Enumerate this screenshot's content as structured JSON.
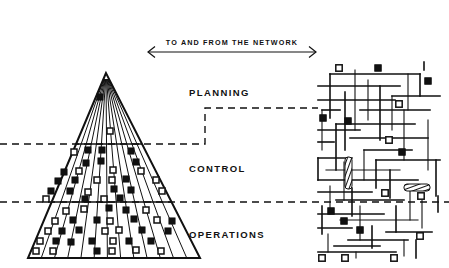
{
  "figure": {
    "title_banner": "TO AND FROM THE NETWORK",
    "background_color": "#ffffff",
    "ink_color": "#111111",
    "width": 449,
    "height": 268
  },
  "tiers": [
    {
      "id": "planning",
      "label": "PLANNING",
      "x": 189,
      "y": 96
    },
    {
      "id": "control",
      "label": "CONTROL",
      "x": 189,
      "y": 172
    },
    {
      "id": "operations",
      "label": "OPERATIONS",
      "x": 189,
      "y": 238
    }
  ],
  "banner_arrow": {
    "label": "TO AND FROM THE NETWORK",
    "label_x": 232,
    "label_y": 45,
    "line_y": 52,
    "x_left": 148,
    "x_right": 316,
    "head_size": 7
  },
  "pyramid": {
    "apex_x": 106,
    "apex_y": 73,
    "base_left_x": 28,
    "base_right_x": 200,
    "base_y": 258,
    "divider_planning_control_y": 144,
    "divider_control_operations_y": 202,
    "wedge_count": 13,
    "node_legend": {
      "filled": "filled-square-node",
      "hollow": "hollow-square-node"
    },
    "nodes": [
      {
        "x": 100,
        "y": 97,
        "type": "filled"
      },
      {
        "x": 110,
        "y": 131,
        "type": "hollow"
      },
      {
        "x": 74,
        "y": 152,
        "type": "hollow"
      },
      {
        "x": 88,
        "y": 150,
        "type": "filled"
      },
      {
        "x": 102,
        "y": 150,
        "type": "filled"
      },
      {
        "x": 131,
        "y": 151,
        "type": "filled"
      },
      {
        "x": 86,
        "y": 163,
        "type": "filled"
      },
      {
        "x": 101,
        "y": 161,
        "type": "filled"
      },
      {
        "x": 136,
        "y": 162,
        "type": "filled"
      },
      {
        "x": 64,
        "y": 172,
        "type": "filled"
      },
      {
        "x": 79,
        "y": 171,
        "type": "hollow"
      },
      {
        "x": 113,
        "y": 170,
        "type": "hollow"
      },
      {
        "x": 141,
        "y": 171,
        "type": "hollow"
      },
      {
        "x": 58,
        "y": 181,
        "type": "filled"
      },
      {
        "x": 75,
        "y": 180,
        "type": "filled"
      },
      {
        "x": 97,
        "y": 180,
        "type": "hollow"
      },
      {
        "x": 112,
        "y": 180,
        "type": "hollow"
      },
      {
        "x": 126,
        "y": 179,
        "type": "filled"
      },
      {
        "x": 156,
        "y": 180,
        "type": "hollow"
      },
      {
        "x": 51,
        "y": 191,
        "type": "filled"
      },
      {
        "x": 70,
        "y": 191,
        "type": "filled"
      },
      {
        "x": 88,
        "y": 192,
        "type": "hollow"
      },
      {
        "x": 114,
        "y": 189,
        "type": "filled"
      },
      {
        "x": 131,
        "y": 190,
        "type": "filled"
      },
      {
        "x": 162,
        "y": 191,
        "type": "hollow"
      },
      {
        "x": 46,
        "y": 199,
        "type": "hollow"
      },
      {
        "x": 85,
        "y": 199,
        "type": "filled"
      },
      {
        "x": 104,
        "y": 199,
        "type": "hollow"
      },
      {
        "x": 120,
        "y": 198,
        "type": "filled"
      },
      {
        "x": 66,
        "y": 211,
        "type": "hollow"
      },
      {
        "x": 84,
        "y": 209,
        "type": "hollow"
      },
      {
        "x": 109,
        "y": 208,
        "type": "filled"
      },
      {
        "x": 126,
        "y": 210,
        "type": "filled"
      },
      {
        "x": 146,
        "y": 210,
        "type": "hollow"
      },
      {
        "x": 55,
        "y": 221,
        "type": "hollow"
      },
      {
        "x": 73,
        "y": 220,
        "type": "filled"
      },
      {
        "x": 97,
        "y": 220,
        "type": "filled"
      },
      {
        "x": 110,
        "y": 221,
        "type": "hollow"
      },
      {
        "x": 134,
        "y": 219,
        "type": "filled"
      },
      {
        "x": 157,
        "y": 220,
        "type": "hollow"
      },
      {
        "x": 172,
        "y": 221,
        "type": "filled"
      },
      {
        "x": 48,
        "y": 231,
        "type": "hollow"
      },
      {
        "x": 62,
        "y": 231,
        "type": "filled"
      },
      {
        "x": 79,
        "y": 230,
        "type": "filled"
      },
      {
        "x": 105,
        "y": 231,
        "type": "hollow"
      },
      {
        "x": 119,
        "y": 230,
        "type": "hollow"
      },
      {
        "x": 142,
        "y": 230,
        "type": "filled"
      },
      {
        "x": 168,
        "y": 231,
        "type": "filled"
      },
      {
        "x": 40,
        "y": 241,
        "type": "hollow"
      },
      {
        "x": 56,
        "y": 241,
        "type": "filled"
      },
      {
        "x": 71,
        "y": 242,
        "type": "filled"
      },
      {
        "x": 92,
        "y": 241,
        "type": "filled"
      },
      {
        "x": 113,
        "y": 241,
        "type": "hollow"
      },
      {
        "x": 129,
        "y": 241,
        "type": "filled"
      },
      {
        "x": 151,
        "y": 241,
        "type": "filled"
      },
      {
        "x": 36,
        "y": 251,
        "type": "hollow"
      },
      {
        "x": 53,
        "y": 251,
        "type": "hollow"
      },
      {
        "x": 97,
        "y": 251,
        "type": "filled"
      },
      {
        "x": 112,
        "y": 251,
        "type": "hollow"
      },
      {
        "x": 136,
        "y": 250,
        "type": "hollow"
      },
      {
        "x": 161,
        "y": 251,
        "type": "hollow"
      }
    ]
  },
  "connector": {
    "description": "stepped dashed link from pyramid tiers to network",
    "upper_step_path": "M 0,144 L 205,144 L 205,108 L 318,108",
    "lower_line_path": "M 0,202 L 449,202"
  },
  "network": {
    "bounds": {
      "x": 316,
      "y": 66,
      "width": 133,
      "height": 196
    },
    "lines": [
      "M 330,74 L 330,118",
      "M 330,74 L 420,74",
      "M 355,70 L 355,130",
      "M 318,86 L 400,86",
      "M 345,92 L 345,150",
      "M 368,80 L 368,120",
      "M 380,86 L 380,140",
      "M 318,100 L 395,100",
      "M 408,74 L 408,110",
      "M 420,74 L 420,96",
      "M 392,96 L 440,96",
      "M 392,96 L 392,130",
      "M 360,110 L 430,110",
      "M 322,110 L 340,110",
      "M 322,110 L 322,150",
      "M 336,124 L 415,124",
      "M 336,124 L 336,170",
      "M 404,110 L 404,160",
      "M 318,130 L 360,130",
      "M 350,138 L 428,138",
      "M 428,120 L 428,170",
      "M 318,142 L 334,142",
      "M 364,150 L 412,150",
      "M 364,150 L 364,180",
      "M 318,158 L 352,158",
      "M 318,158 L 318,180",
      "M 344,162 L 344,200",
      "M 376,160 L 440,160",
      "M 376,160 L 376,188",
      "M 326,170 L 400,170",
      "M 390,170 L 390,198",
      "M 318,180 L 418,180",
      "M 330,186 L 330,214",
      "M 352,188 L 352,216",
      "M 318,192 L 372,192",
      "M 410,186 L 410,220",
      "M 336,200 L 404,200",
      "M 322,206 L 322,234",
      "M 360,206 L 360,240",
      "M 318,214 L 384,214",
      "M 396,206 L 396,232",
      "M 340,220 L 418,220",
      "M 372,226 L 372,248",
      "M 318,228 L 352,228",
      "M 328,234 L 328,252",
      "M 386,232 L 432,232",
      "M 348,240 L 408,240",
      "M 404,240 L 404,256",
      "M 334,246 L 380,246",
      "M 318,252 L 396,252",
      "M 422,200 L 422,228",
      "M 436,160 L 436,196",
      "M 416,240 L 416,258",
      "M 356,252 L 356,258"
    ],
    "nodes": [
      {
        "x": 339,
        "y": 68,
        "type": "hollow"
      },
      {
        "x": 378,
        "y": 68,
        "type": "filled"
      },
      {
        "x": 428,
        "y": 81,
        "type": "filled"
      },
      {
        "x": 399,
        "y": 104,
        "type": "hollow"
      },
      {
        "x": 323,
        "y": 118,
        "type": "filled"
      },
      {
        "x": 348,
        "y": 121,
        "type": "filled"
      },
      {
        "x": 389,
        "y": 140,
        "type": "hollow"
      },
      {
        "x": 402,
        "y": 152,
        "type": "filled"
      },
      {
        "x": 385,
        "y": 193,
        "type": "hollow"
      },
      {
        "x": 421,
        "y": 196,
        "type": "hollow"
      },
      {
        "x": 331,
        "y": 211,
        "type": "filled"
      },
      {
        "x": 344,
        "y": 221,
        "type": "filled"
      },
      {
        "x": 360,
        "y": 230,
        "type": "filled"
      },
      {
        "x": 420,
        "y": 236,
        "type": "hollow"
      },
      {
        "x": 322,
        "y": 258,
        "type": "hollow"
      },
      {
        "x": 345,
        "y": 258,
        "type": "hollow"
      },
      {
        "x": 394,
        "y": 258,
        "type": "hollow"
      }
    ],
    "coil_elements": [
      {
        "id": "vertical-coil",
        "x": 345,
        "y": 157,
        "width": 7,
        "height": 32,
        "orientation": "vertical"
      },
      {
        "id": "horizontal-coil",
        "x": 404,
        "y": 184,
        "width": 26,
        "height": 7,
        "orientation": "horizontal"
      }
    ],
    "tick_marks": [
      {
        "x1": 438,
        "y1": 196,
        "x2": 438,
        "y2": 212
      },
      {
        "x1": 424,
        "y1": 62,
        "x2": 424,
        "y2": 70
      }
    ]
  }
}
